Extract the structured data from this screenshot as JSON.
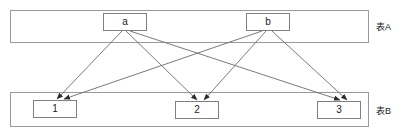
{
  "diagram": {
    "type": "bipartite-mapping",
    "title": "",
    "stroke_color": "#6b6b6b",
    "container_stroke_color": "#9a9a9a",
    "node_stroke_color": "#808080",
    "background_color": "#ffffff",
    "text_color": "#1a1a1a"
  },
  "containers": [
    {
      "id": "tableA",
      "label": "表A",
      "x": 10,
      "y": 10,
      "width": 358,
      "height": 32
    },
    {
      "id": "tableB",
      "label": "表B",
      "x": 10,
      "y": 92,
      "width": 358,
      "height": 34
    }
  ],
  "labels": [
    {
      "id": "labelA",
      "text": "表A",
      "x": 376,
      "y": 20
    },
    {
      "id": "labelB",
      "text": "表B",
      "x": 376,
      "y": 104
    }
  ],
  "nodes": [
    {
      "id": "a",
      "label": "a",
      "group": "tableA",
      "x": 103,
      "y": 13,
      "width": 44,
      "height": 18
    },
    {
      "id": "b",
      "label": "b",
      "group": "tableA",
      "x": 246,
      "y": 13,
      "width": 44,
      "height": 18
    },
    {
      "id": "n1",
      "label": "1",
      "group": "tableB",
      "x": 33,
      "y": 100,
      "width": 44,
      "height": 18
    },
    {
      "id": "n2",
      "label": "2",
      "group": "tableB",
      "x": 175,
      "y": 101,
      "width": 44,
      "height": 18
    },
    {
      "id": "n3",
      "label": "3",
      "group": "tableB",
      "x": 317,
      "y": 101,
      "width": 44,
      "height": 18
    }
  ],
  "edges": [
    {
      "id": "a-1",
      "from": "a",
      "to": "n1",
      "x1": 122,
      "y1": 31,
      "x2": 57,
      "y2": 99
    },
    {
      "id": "a-2",
      "from": "a",
      "to": "n2",
      "x1": 126,
      "y1": 31,
      "x2": 197,
      "y2": 100
    },
    {
      "id": "a-3",
      "from": "a",
      "to": "n3",
      "x1": 130,
      "y1": 31,
      "x2": 340,
      "y2": 100
    },
    {
      "id": "b-1",
      "from": "b",
      "to": "n1",
      "x1": 262,
      "y1": 31,
      "x2": 64,
      "y2": 99
    },
    {
      "id": "b-2",
      "from": "b",
      "to": "n2",
      "x1": 266,
      "y1": 31,
      "x2": 204,
      "y2": 100
    },
    {
      "id": "b-3",
      "from": "b",
      "to": "n3",
      "x1": 272,
      "y1": 31,
      "x2": 347,
      "y2": 100
    }
  ]
}
